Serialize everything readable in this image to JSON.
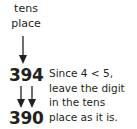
{
  "label": {
    "line1": "tens",
    "line2": "place"
  },
  "original_number": "394",
  "rounded_number": "390",
  "explanation": {
    "line1": "Since 4 < 5,",
    "line2": "leave the digit",
    "line3": "in the tens",
    "line4": "place as it is."
  },
  "colors": {
    "text": "#231f20",
    "arrow": "#231f20"
  }
}
